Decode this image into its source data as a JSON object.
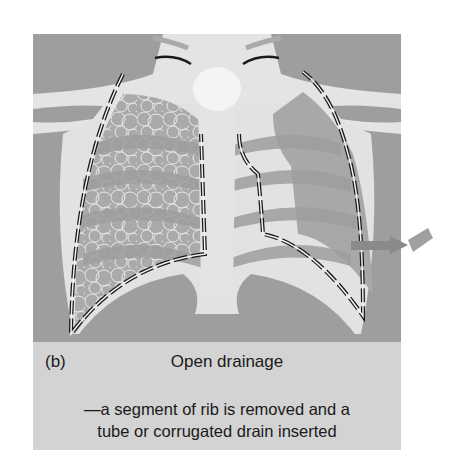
{
  "figure": {
    "panel_label": "(b)",
    "title": "Open drainage",
    "description_line1": "—a segment of rib is removed and a",
    "description_line2": "tube or corrugated drain inserted",
    "colors": {
      "background_dark": "#9e9e9e",
      "bone_light": "#e6e6e6",
      "lung_fill": "#c4c4c4",
      "caption_bg": "#d3d3d3",
      "outline_dark": "#1a1a1a",
      "arrow": "#8a8a8a"
    }
  }
}
